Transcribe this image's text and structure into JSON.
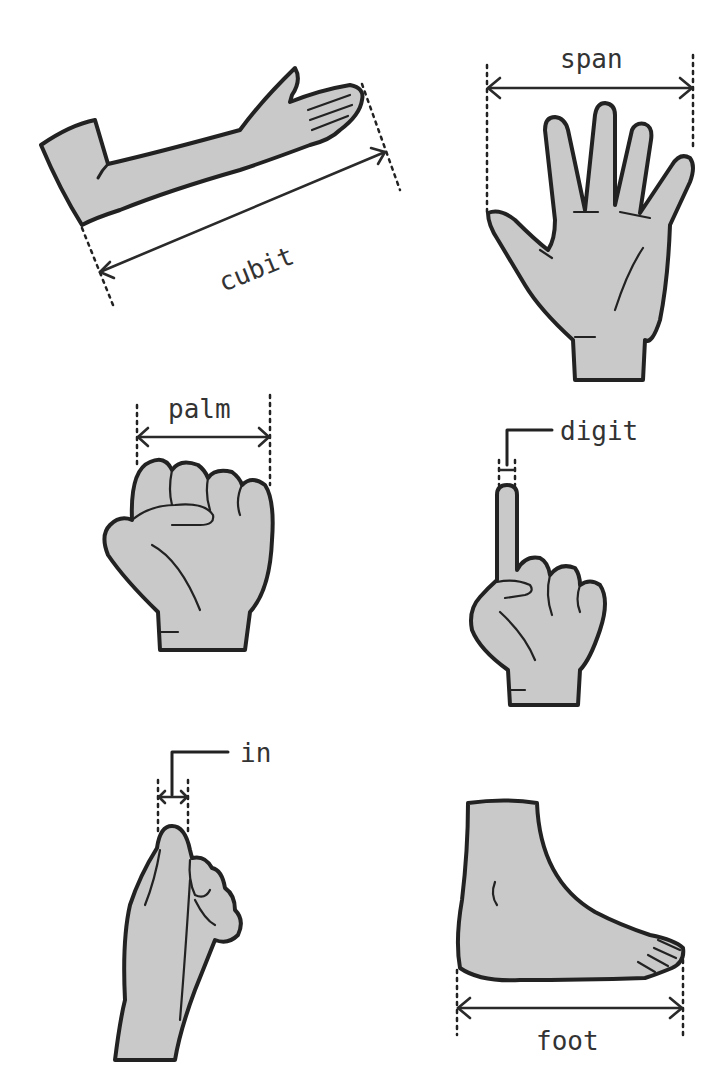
{
  "colors": {
    "skin_fill": "#c9c9c9",
    "outline": "#222222",
    "label_text": "#333333",
    "background": "#ffffff"
  },
  "panels": [
    {
      "id": "cubit",
      "label": "cubit",
      "illustration": "forearm-and-hand",
      "measures": "elbow to fingertip"
    },
    {
      "id": "span",
      "label": "span",
      "illustration": "open-hand",
      "measures": "thumb tip to little finger tip"
    },
    {
      "id": "palm",
      "label": "palm",
      "illustration": "fist",
      "measures": "width across four knuckles"
    },
    {
      "id": "digit",
      "label": "digit",
      "illustration": "pointing-finger",
      "measures": "width of one finger"
    },
    {
      "id": "inch",
      "label": "in",
      "illustration": "thumbs-up-side",
      "measures": "width of thumb"
    },
    {
      "id": "foot",
      "label": "foot",
      "illustration": "foot-side-view",
      "measures": "heel to toe"
    }
  ]
}
